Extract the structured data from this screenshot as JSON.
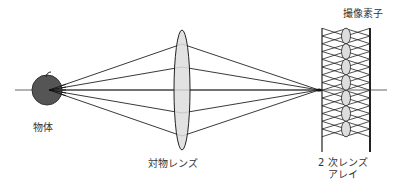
{
  "labels": {
    "object": "物体",
    "objective_lens": "対物レンズ",
    "secondary_lens_array_line1": "2 次レンズ",
    "secondary_lens_array_line2": "アレイ",
    "image_sensor": "撮像素子"
  },
  "colors": {
    "line": "#222222",
    "object_fill": "#555555",
    "lens_fill": "#dddddd",
    "axis": "#666666"
  },
  "components": {
    "ray_count": 5,
    "lenslet_count": 7
  }
}
